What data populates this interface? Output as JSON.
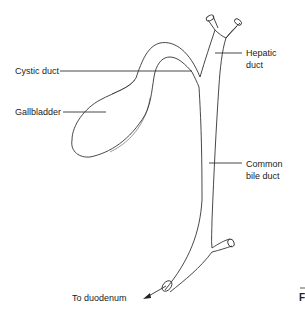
{
  "diagram": {
    "labels": {
      "cystic_duct": "Cystic duct",
      "gallbladder": "Gallbladder",
      "hepatic_duct_line1": "Hepatic",
      "hepatic_duct_line2": "duct",
      "common_bile_duct_line1": "Common",
      "common_bile_duct_line2": "bile duct",
      "to_duodenum": "To duodenum"
    },
    "cut_off_text": "F",
    "line_color": "#333333"
  }
}
